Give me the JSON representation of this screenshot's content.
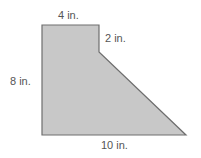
{
  "figure": {
    "type": "composite polygon",
    "fill_color": "#c8c8c8",
    "stroke_color": "#6e6e6e",
    "labels": {
      "top": "4 in.",
      "right_step": "2 in.",
      "left": "8 in.",
      "bottom": "10 in."
    },
    "points": "42,25 99,25 99,52 186,135 42,135"
  }
}
